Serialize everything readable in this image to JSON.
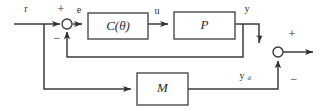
{
  "diagram": {
    "type": "control-system-block-diagram",
    "background_color": "#ffffff",
    "line_color": "#3b3b3b",
    "blocks": [
      {
        "id": "controller",
        "label": "C(θ)",
        "x": 88,
        "y": 13,
        "w": 60,
        "h": 26
      },
      {
        "id": "plant",
        "label": "P",
        "x": 174,
        "y": 12,
        "w": 61,
        "h": 27
      },
      {
        "id": "model",
        "label": "M",
        "x": 137,
        "y": 73,
        "w": 51,
        "h": 32
      }
    ],
    "signals": {
      "reference": "r",
      "error": "e",
      "control": "u",
      "output": "y",
      "desired_output": "y",
      "desired_output_subscript": "d"
    },
    "sum_junctions": [
      {
        "id": "error-junction",
        "cx": 67,
        "cy": 24,
        "r": 5,
        "plus_sign": "+",
        "minus_sign": "−"
      },
      {
        "id": "output-junction",
        "cx": 278,
        "cy": 52,
        "r": 5,
        "plus_sign": "+",
        "minus_sign": "−"
      }
    ]
  }
}
